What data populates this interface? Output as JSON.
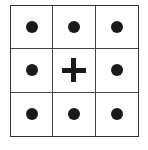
{
  "grid": {
    "rows": 3,
    "cols": 3,
    "cells": [
      {
        "symbol": "dot"
      },
      {
        "symbol": "dot"
      },
      {
        "symbol": "dot"
      },
      {
        "symbol": "dot"
      },
      {
        "symbol": "plus"
      },
      {
        "symbol": "dot"
      },
      {
        "symbol": "dot"
      },
      {
        "symbol": "dot"
      },
      {
        "symbol": "dot"
      }
    ],
    "colors": {
      "line": "#333333",
      "symbol": "#1a1a1a",
      "background": "#ffffff"
    }
  }
}
